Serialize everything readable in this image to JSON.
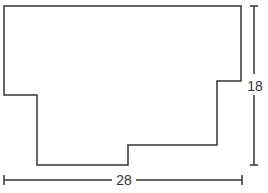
{
  "diagram": {
    "type": "rectilinear-polygon-with-dimensions",
    "stroke_color": "#333333",
    "dimensions": {
      "height_label": "18",
      "width_label": "28"
    }
  }
}
